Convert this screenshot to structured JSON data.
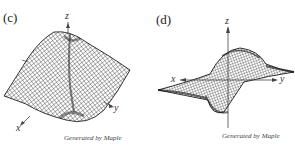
{
  "figures": [
    {
      "label": "(c)",
      "axes": {
        "x": "x",
        "y": "y",
        "z": "z"
      },
      "caption": "Generated by Maple"
    },
    {
      "label": "(d)",
      "axes": {
        "x": "x",
        "y": "y",
        "z": "z"
      },
      "caption": "Generated by Maple"
    }
  ]
}
